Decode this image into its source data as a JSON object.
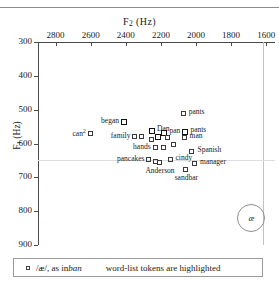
{
  "figure": {
    "top_cut_text": "",
    "x_axis": {
      "title": "F",
      "title_sub": "2",
      "title_unit": "(Hz)",
      "ticks": [
        2800,
        2600,
        2400,
        2200,
        2000,
        1800,
        1600
      ],
      "min": 2900,
      "max": 1550,
      "reversed": true
    },
    "y_axis": {
      "title": "F",
      "title_sub": "1",
      "title_unit": "(Hz)",
      "ticks": [
        300,
        400,
        500,
        600,
        700,
        800,
        900
      ],
      "min": 300,
      "max": 900,
      "reversed": true
    },
    "vowel_marker": {
      "symbol": "æ",
      "f2": 1690,
      "f1": 818
    },
    "legend": {
      "swatch": "open-square",
      "ipa_text": "/æ/, as in ",
      "example_word": "ban",
      "highlight_note": "word-list tokens are highlighted"
    }
  },
  "chart_data": {
    "type": "scatter",
    "title": "",
    "xlabel": "F2 (Hz)",
    "ylabel": "F1 (Hz)",
    "xlim": [
      2900,
      1550
    ],
    "ylim": [
      900,
      300
    ],
    "grid": false,
    "legend_position": "below-plot",
    "x_ticks": [
      2800,
      2600,
      2400,
      2200,
      2000,
      1800,
      1600
    ],
    "y_ticks": [
      300,
      400,
      500,
      600,
      700,
      800,
      900
    ],
    "reference_lines": {
      "vertical_f2": 1620,
      "horizontal_f1": 648
    },
    "series": [
      {
        "name": "/æ/ tokens",
        "marker": "open square",
        "points": [
          {
            "label": "pants",
            "f2": 2070,
            "f1": 512,
            "highlighted": false,
            "label_side": "r"
          },
          {
            "label": "began",
            "f2": 2410,
            "f1": 537,
            "highlighted": true,
            "label_side": "l"
          },
          {
            "label": "Dan",
            "f2": 2250,
            "f1": 563,
            "highlighted": true,
            "label_side": "r"
          },
          {
            "label": "pan",
            "f2": 2180,
            "f1": 570,
            "highlighted": true,
            "label_side": "r"
          },
          {
            "label": "pants",
            "f2": 2060,
            "f1": 566,
            "highlighted": true,
            "label_side": "r"
          },
          {
            "label": "can2",
            "f2": 2600,
            "f1": 572,
            "highlighted": false,
            "label_side": "l"
          },
          {
            "label": "man",
            "f2": 2065,
            "f1": 584,
            "highlighted": false,
            "label_side": "r"
          },
          {
            "label": "family",
            "f2": 2345,
            "f1": 582,
            "highlighted": false,
            "label_side": "l"
          },
          {
            "label": "",
            "f2": 2310,
            "f1": 582,
            "highlighted": false,
            "label_side": "r"
          },
          {
            "label": "",
            "f2": 2215,
            "f1": 580,
            "highlighted": true,
            "label_side": "r"
          },
          {
            "label": "",
            "f2": 2160,
            "f1": 583,
            "highlighted": false,
            "label_side": "r"
          },
          {
            "label": "",
            "f2": 2250,
            "f1": 590,
            "highlighted": false,
            "label_side": "r"
          },
          {
            "label": "hands",
            "f2": 2230,
            "f1": 613,
            "highlighted": false,
            "label_side": "l"
          },
          {
            "label": "",
            "f2": 2185,
            "f1": 613,
            "highlighted": false,
            "label_side": "r"
          },
          {
            "label": "",
            "f2": 2125,
            "f1": 604,
            "highlighted": false,
            "label_side": "r"
          },
          {
            "label": "Spanish",
            "f2": 2020,
            "f1": 625,
            "highlighted": false,
            "label_side": "r"
          },
          {
            "label": "pancakes",
            "f2": 2265,
            "f1": 648,
            "highlighted": false,
            "label_side": "l"
          },
          {
            "label": "",
            "f2": 2230,
            "f1": 655,
            "highlighted": false,
            "label_side": "r"
          },
          {
            "label": "Anderson",
            "f2": 2205,
            "f1": 658,
            "highlighted": false,
            "label_side": "c"
          },
          {
            "label": "cindy",
            "f2": 2145,
            "f1": 650,
            "highlighted": false,
            "label_side": "r"
          },
          {
            "label": "manager",
            "f2": 2005,
            "f1": 662,
            "highlighted": false,
            "label_side": "r"
          },
          {
            "label": "sandbar",
            "f2": 2055,
            "f1": 678,
            "highlighted": false,
            "label_side": "c"
          }
        ]
      }
    ]
  }
}
